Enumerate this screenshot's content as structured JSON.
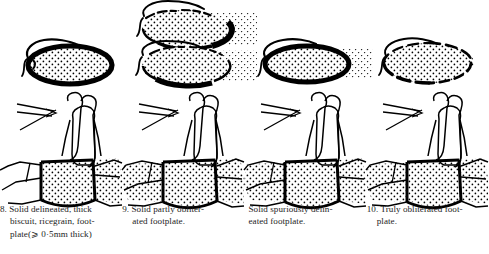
{
  "figure": {
    "kind": "anatomical-illustration-plate",
    "row_top_label": "oval window / footplate surface view",
    "row_bottom_label": "stapes cross-section view",
    "background_color": "#ffffff",
    "ink_color": "#000000"
  },
  "columns": [
    {
      "number": "8.",
      "caption_lines": [
        "8. Solid delineated, thick",
        "biscuit, ricegrain, foot-",
        "plate(⩾ 0·5mm thick)"
      ],
      "top_view": {
        "name": "solid-delineated-thick-footplate-oval",
        "outline": "continuous-thick",
        "fill": "stippled",
        "halo_stipple": false,
        "ovals": 1
      },
      "bottom_view": {
        "name": "stapes-cross-section-solid-delineated",
        "footplate": "thick-stippled-delineated"
      }
    },
    {
      "number": "9.",
      "caption_lines": [
        "9. Solid partly obliter-",
        "ated footplate."
      ],
      "top_view": {
        "name": "solid-partly-obliterated-footplate-oval",
        "outline": "partly-broken",
        "fill": "stippled",
        "halo_stipple": true,
        "ovals": 2
      },
      "bottom_view": {
        "name": "stapes-cross-section-partly-obliterated",
        "footplate": "stippled-merging-with-surrounding-bone"
      }
    },
    {
      "number": "",
      "caption_lines": [
        "Solid spuriously delin-",
        "eated footplate."
      ],
      "top_view": {
        "name": "solid-spuriously-delineated-footplate-oval",
        "outline": "continuous-thick",
        "fill": "stippled",
        "halo_stipple": true,
        "ovals": 1
      },
      "bottom_view": {
        "name": "stapes-cross-section-spuriously-delineated",
        "footplate": "stippled-with-adjacent-stippled-bone"
      }
    },
    {
      "number": "10.",
      "caption_lines": [
        "10. Truly obliterated foot-",
        "plate."
      ],
      "top_view": {
        "name": "truly-obliterated-footplate-oval",
        "outline": "dashed-broken",
        "fill": "stippled",
        "halo_stipple": true,
        "ovals": 1
      },
      "bottom_view": {
        "name": "stapes-cross-section-truly-obliterated",
        "footplate": "fully-stippled-continuous-with-bone"
      }
    }
  ]
}
